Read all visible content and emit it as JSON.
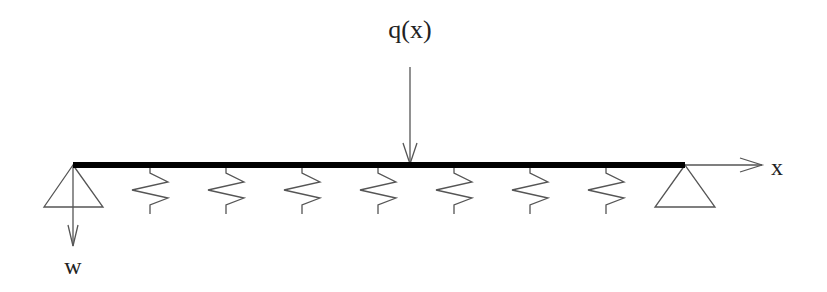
{
  "diagram": {
    "labels": {
      "load": "q(x)",
      "axis_x": "x",
      "deflection": "w"
    },
    "beam": {
      "x_start": 73,
      "x_end": 685,
      "y": 165,
      "thickness": 5,
      "color": "#000000"
    },
    "supports": [
      {
        "name": "left-support",
        "apex_x": 73,
        "apex_y": 165,
        "base_left": 44,
        "base_right": 103,
        "base_y": 207
      },
      {
        "name": "right-support",
        "apex_x": 685,
        "apex_y": 165,
        "base_left": 655,
        "base_right": 715,
        "base_y": 207
      }
    ],
    "springs": {
      "count": 7,
      "centers_x": [
        150,
        226,
        302,
        378,
        454,
        530,
        606
      ]
    },
    "load_arrow": {
      "x": 410,
      "y_start": 67,
      "y_end": 165
    },
    "axis_arrow": {
      "x_start": 685,
      "x_end": 762,
      "y": 165
    },
    "deflection_arrow": {
      "x": 73,
      "y_start": 165,
      "y_end": 246
    },
    "line_color": "#555555"
  }
}
